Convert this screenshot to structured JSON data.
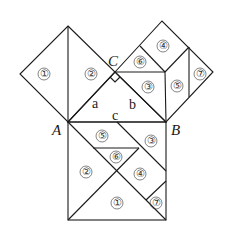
{
  "vertices": {
    "A": {
      "label": "A",
      "x": 68,
      "y": 122
    },
    "B": {
      "label": "B",
      "x": 166,
      "y": 122
    },
    "C": {
      "label": "C",
      "x": 115,
      "y": 72
    }
  },
  "sides": {
    "a": "a",
    "b": "b",
    "c": "c"
  },
  "pieces": {
    "left_square": [
      {
        "label": "①",
        "x": 44,
        "y": 74
      },
      {
        "label": "②",
        "x": 91,
        "y": 74
      }
    ],
    "right_square": [
      {
        "label": "⑥",
        "x": 140,
        "y": 62
      },
      {
        "label": "④",
        "x": 163,
        "y": 46
      },
      {
        "label": "③",
        "x": 148,
        "y": 87
      },
      {
        "label": "⑤",
        "x": 177,
        "y": 86
      },
      {
        "label": "⑦",
        "x": 200,
        "y": 74
      }
    ],
    "bottom_square": [
      {
        "label": "⑤",
        "x": 102,
        "y": 136
      },
      {
        "label": "③",
        "x": 151,
        "y": 141
      },
      {
        "label": "⑥",
        "x": 116,
        "y": 157
      },
      {
        "label": "②",
        "x": 86,
        "y": 172
      },
      {
        "label": "④",
        "x": 140,
        "y": 174
      },
      {
        "label": "①",
        "x": 117,
        "y": 203
      },
      {
        "label": "⑦",
        "x": 156,
        "y": 203
      }
    ]
  },
  "colors": {
    "line": "#1a1a1a",
    "background": "#ffffff"
  }
}
